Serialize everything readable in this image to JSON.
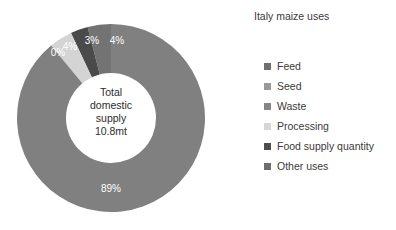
{
  "chart_data": {
    "type": "pie",
    "title": "Italy maize uses",
    "subtitle": "",
    "xlabel": "",
    "ylabel": "",
    "donut": true,
    "legend_position": "right",
    "grid": false,
    "center_label": {
      "line1": "Total",
      "line2": "domestic",
      "line3": "supply",
      "line4": "10.8mt"
    },
    "categories": [
      "Feed",
      "Seed",
      "Waste",
      "Processing",
      "Food supply quantity",
      "Other uses"
    ],
    "values": [
      89,
      0,
      0,
      4,
      3,
      4
    ],
    "data_labels": [
      "89%",
      "0%",
      "0%",
      "4%",
      "3%",
      "4%"
    ],
    "colors": [
      "#808080",
      "#999999",
      "#8c8c8c",
      "#d4d4d4",
      "#4a4a4a",
      "#737373"
    ],
    "slices": [
      {
        "name": "Feed",
        "value": 89,
        "label": "89%",
        "color": "#808080"
      },
      {
        "name": "Seed",
        "value": 0,
        "label": "0%",
        "color": "#999999"
      },
      {
        "name": "Waste",
        "value": 0,
        "label": "0%",
        "color": "#8c8c8c"
      },
      {
        "name": "Processing",
        "value": 4,
        "label": "4%",
        "color": "#d4d4d4"
      },
      {
        "name": "Food supply quantity",
        "value": 3,
        "label": "3%",
        "color": "#4a4a4a"
      },
      {
        "name": "Other uses",
        "value": 4,
        "label": "4%",
        "color": "#737373"
      }
    ]
  },
  "legend": {
    "title": "Italy maize uses",
    "items": [
      {
        "label": "Feed",
        "color": "#707070"
      },
      {
        "label": "Seed",
        "color": "#9a9a9a"
      },
      {
        "label": "Waste",
        "color": "#858585"
      },
      {
        "label": "Processing",
        "color": "#d6d6d6"
      },
      {
        "label": "Food supply quantity",
        "color": "#4f4f4f"
      },
      {
        "label": "Other uses",
        "color": "#6e6e6e"
      }
    ]
  },
  "slice_labels": {
    "zero": "0%",
    "four_a": "4%",
    "three": "3%",
    "four_b": "4%",
    "eightynine": "89%"
  }
}
